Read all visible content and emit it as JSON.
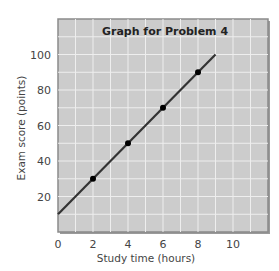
{
  "chart_data": {
    "type": "line",
    "title": "Graph for Problem 4",
    "xlabel": "Study time (hours)",
    "ylabel": "Exam score (points)",
    "x_ticks": [
      0,
      2,
      4,
      6,
      8,
      10
    ],
    "y_ticks": [
      20,
      40,
      60,
      80,
      100
    ],
    "xlim": [
      0,
      12
    ],
    "ylim": [
      0,
      120
    ],
    "grid": true,
    "legend": "none",
    "series": [
      {
        "name": "Exam score",
        "line": {
          "x": [
            0,
            9
          ],
          "y": [
            10,
            100
          ]
        },
        "points": {
          "x": [
            2,
            4,
            6,
            8
          ],
          "y": [
            30,
            50,
            70,
            90
          ]
        }
      }
    ]
  },
  "colors": {
    "plot_background": "#cccccc",
    "grid": "#eeeeee",
    "frame": "#8a8a8a",
    "line": "#333333",
    "points": "#000000"
  }
}
